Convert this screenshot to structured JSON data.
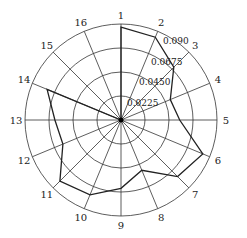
{
  "chart_data": {
    "type": "radar",
    "title": "",
    "categories": [
      "1",
      "2",
      "3",
      "4",
      "5",
      "6",
      "7",
      "8",
      "9",
      "10",
      "11",
      "12",
      "13",
      "14",
      "15",
      "16"
    ],
    "series": [
      {
        "name": "series",
        "values": [
          0.087,
          0.084,
          0.07,
          0.05,
          0.055,
          0.083,
          0.075,
          0.051,
          0.064,
          0.076,
          0.081,
          0.059,
          0.062,
          0.075,
          0.0,
          0.0
        ]
      }
    ],
    "rlim": [
      0,
      0.09
    ],
    "ring_ticks": [
      0.0225,
      0.045,
      0.0675,
      0.09
    ],
    "ring_labels": [
      "0.0225",
      "0.0450",
      "0.0675",
      "0.090"
    ],
    "grid": true,
    "start_angle": "top",
    "direction": "clockwise"
  },
  "colors": {
    "line": "#222222",
    "grid": "#333333"
  }
}
